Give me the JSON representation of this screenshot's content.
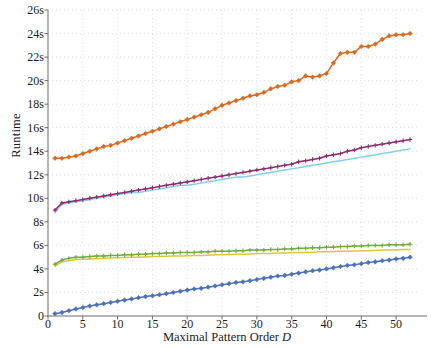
{
  "chart_data": {
    "type": "line",
    "title": "",
    "xlabel": "Maximal Pattern Order D",
    "ylabel": "Runtime",
    "xlim": [
      0,
      53
    ],
    "ylim": [
      0,
      26
    ],
    "grid": true,
    "legend": "none",
    "y_tick_labels": [
      "0",
      "2s",
      "4s",
      "6s",
      "8s",
      "10s",
      "12s",
      "14s",
      "16s",
      "18s",
      "20s",
      "22s",
      "24s",
      "26s"
    ],
    "y_tick_values": [
      0,
      2,
      4,
      6,
      8,
      10,
      12,
      14,
      16,
      18,
      20,
      22,
      24,
      26
    ],
    "x_tick_labels": [
      "0",
      "5",
      "10",
      "15",
      "20",
      "25",
      "30",
      "35",
      "40",
      "45",
      "50"
    ],
    "x_tick_values": [
      0,
      5,
      10,
      15,
      20,
      25,
      30,
      35,
      40,
      45,
      50
    ],
    "x": [
      1,
      2,
      3,
      4,
      5,
      6,
      7,
      8,
      9,
      10,
      11,
      12,
      13,
      14,
      15,
      16,
      17,
      18,
      19,
      20,
      21,
      22,
      23,
      24,
      25,
      26,
      27,
      28,
      29,
      30,
      31,
      32,
      33,
      34,
      35,
      36,
      37,
      38,
      39,
      40,
      41,
      42,
      43,
      44,
      45,
      46,
      47,
      48,
      49,
      50,
      51,
      52
    ],
    "series": [
      {
        "name": "orange-series",
        "color": "#D96A22",
        "marker": "diamond",
        "values": [
          13.4,
          13.4,
          13.5,
          13.6,
          13.8,
          14.0,
          14.2,
          14.4,
          14.5,
          14.7,
          14.9,
          15.1,
          15.3,
          15.5,
          15.7,
          15.9,
          16.1,
          16.3,
          16.5,
          16.7,
          16.9,
          17.1,
          17.3,
          17.6,
          17.9,
          18.1,
          18.3,
          18.5,
          18.7,
          18.8,
          19.0,
          19.3,
          19.5,
          19.6,
          19.9,
          20.0,
          20.4,
          20.3,
          20.4,
          20.6,
          21.5,
          22.3,
          22.4,
          22.4,
          22.9,
          22.9,
          23.1,
          23.5,
          23.8,
          23.9,
          23.9,
          24.0
        ]
      },
      {
        "name": "purple-series",
        "color": "#8E2C6E",
        "marker": "plus",
        "values": [
          9.0,
          9.6,
          9.7,
          9.8,
          9.9,
          10.0,
          10.1,
          10.2,
          10.3,
          10.4,
          10.5,
          10.6,
          10.7,
          10.8,
          10.9,
          11.0,
          11.1,
          11.2,
          11.3,
          11.4,
          11.5,
          11.6,
          11.7,
          11.8,
          11.9,
          12.0,
          12.1,
          12.2,
          12.3,
          12.4,
          12.5,
          12.6,
          12.7,
          12.8,
          12.9,
          13.1,
          13.2,
          13.3,
          13.4,
          13.6,
          13.7,
          13.8,
          14.0,
          14.1,
          14.3,
          14.4,
          14.5,
          14.6,
          14.7,
          14.8,
          14.9,
          15.0
        ]
      },
      {
        "name": "cyan-series",
        "color": "#7FD1E8",
        "marker": "none",
        "values": [
          8.8,
          9.5,
          9.6,
          9.7,
          9.8,
          9.9,
          10.0,
          10.1,
          10.2,
          10.3,
          10.4,
          10.5,
          10.5,
          10.6,
          10.7,
          10.8,
          10.9,
          11.0,
          11.1,
          11.1,
          11.2,
          11.3,
          11.4,
          11.5,
          11.6,
          11.7,
          11.8,
          11.8,
          11.9,
          12.0,
          12.1,
          12.2,
          12.3,
          12.4,
          12.5,
          12.6,
          12.7,
          12.8,
          12.9,
          13.0,
          13.1,
          13.2,
          13.3,
          13.4,
          13.5,
          13.6,
          13.7,
          13.8,
          13.9,
          14.0,
          14.1,
          14.2
        ]
      },
      {
        "name": "green-series",
        "color": "#6FAE3B",
        "marker": "plus",
        "values": [
          4.4,
          4.75,
          4.9,
          5.0,
          5.0,
          5.05,
          5.1,
          5.1,
          5.15,
          5.15,
          5.2,
          5.2,
          5.25,
          5.25,
          5.3,
          5.3,
          5.35,
          5.35,
          5.4,
          5.4,
          5.4,
          5.45,
          5.45,
          5.5,
          5.5,
          5.5,
          5.55,
          5.55,
          5.6,
          5.6,
          5.6,
          5.65,
          5.65,
          5.7,
          5.7,
          5.75,
          5.75,
          5.8,
          5.8,
          5.85,
          5.85,
          5.9,
          5.9,
          5.95,
          5.95,
          6.0,
          6.0,
          6.0,
          6.05,
          6.05,
          6.05,
          6.1
        ]
      },
      {
        "name": "yellow-series",
        "color": "#E3C43C",
        "marker": "none",
        "values": [
          4.25,
          4.6,
          4.7,
          4.8,
          4.82,
          4.85,
          4.87,
          4.9,
          4.92,
          4.95,
          4.97,
          5.0,
          5.0,
          5.02,
          5.05,
          5.05,
          5.07,
          5.1,
          5.1,
          5.12,
          5.15,
          5.15,
          5.17,
          5.2,
          5.2,
          5.22,
          5.25,
          5.25,
          5.27,
          5.3,
          5.3,
          5.32,
          5.35,
          5.35,
          5.37,
          5.4,
          5.4,
          5.42,
          5.45,
          5.45,
          5.47,
          5.5,
          5.5,
          5.52,
          5.55,
          5.55,
          5.57,
          5.6,
          5.6,
          5.62,
          5.65,
          5.65
        ]
      },
      {
        "name": "blue-series",
        "color": "#4A72B8",
        "marker": "diamond",
        "values": [
          0.2,
          0.3,
          0.45,
          0.6,
          0.72,
          0.85,
          0.95,
          1.05,
          1.15,
          1.25,
          1.35,
          1.45,
          1.55,
          1.65,
          1.72,
          1.8,
          1.9,
          2.0,
          2.1,
          2.2,
          2.3,
          2.35,
          2.45,
          2.55,
          2.65,
          2.75,
          2.85,
          2.9,
          3.0,
          3.1,
          3.2,
          3.3,
          3.4,
          3.45,
          3.55,
          3.65,
          3.75,
          3.85,
          3.9,
          4.0,
          4.1,
          4.2,
          4.3,
          4.35,
          4.45,
          4.55,
          4.6,
          4.7,
          4.75,
          4.85,
          4.9,
          5.0
        ]
      }
    ]
  },
  "axes": {
    "x_title": "Maximal Pattern Order ",
    "x_title_italic": "D",
    "y_title": "Runtime"
  }
}
